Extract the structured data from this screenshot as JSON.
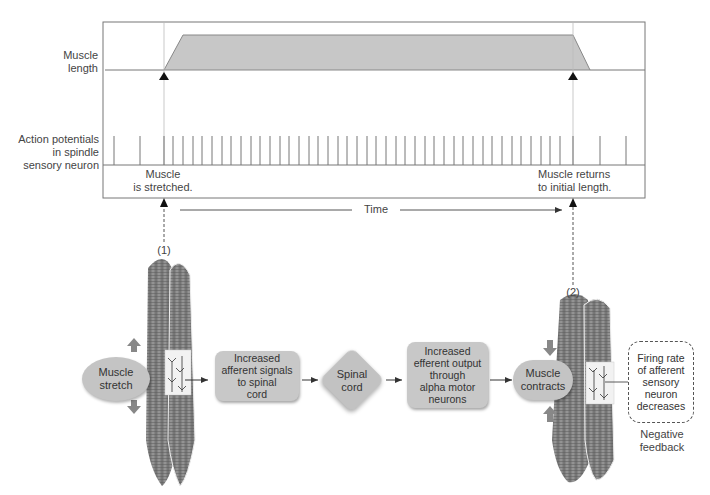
{
  "chart": {
    "muscle_length_label_1": "Muscle",
    "muscle_length_label_2": "length",
    "ap_label_1": "Action potentials",
    "ap_label_2": "in spindle",
    "ap_label_3": "sensory neuron",
    "event1_line1": "Muscle",
    "event1_line2": "is stretched.",
    "event2_line1": "Muscle returns",
    "event2_line2": "to initial length.",
    "time_label": "Time"
  },
  "chart_data": {
    "type": "line",
    "title": "",
    "series": [
      {
        "name": "Muscle length",
        "description": "baseline, rises after stretch, plateau, returns to initial length",
        "x": [
          0,
          0.11,
          0.15,
          0.87,
          0.9,
          1.0
        ],
        "values": [
          0,
          0,
          1,
          1,
          0,
          0
        ]
      },
      {
        "name": "Action potentials in spindle sensory neuron",
        "description": "spike train: low rate before stretch, high rate during stretch, low rate after return",
        "spike_x": [
          114,
          140,
          164,
          173,
          183,
          193,
          202,
          212,
          222,
          231,
          241,
          251,
          260,
          270,
          280,
          289,
          299,
          309,
          318,
          328,
          338,
          347,
          357,
          367,
          376,
          386,
          396,
          405,
          415,
          425,
          434,
          444,
          454,
          463,
          473,
          483,
          492,
          502,
          512,
          521,
          531,
          541,
          550,
          560,
          573,
          600,
          626
        ]
      }
    ],
    "xlabel": "Time",
    "annotations": [
      "Muscle is stretched.",
      "Muscle returns to initial length."
    ]
  },
  "markers": {
    "step1": "(1)",
    "step2": "(2)"
  },
  "flow": {
    "muscle_stretch_1": "Muscle",
    "muscle_stretch_2": "stretch",
    "afferent_1": "Increased",
    "afferent_2": "afferent signals",
    "afferent_3": "to spinal",
    "afferent_4": "cord",
    "spinal_1": "Spinal",
    "spinal_2": "cord",
    "efferent_1": "Increased",
    "efferent_2": "efferent output",
    "efferent_3": "through",
    "efferent_4": "alpha motor",
    "efferent_5": "neurons",
    "contracts_1": "Muscle",
    "contracts_2": "contracts",
    "firing_1": "Firing rate",
    "firing_2": "of afferent",
    "firing_3": "sensory",
    "firing_4": "neuron",
    "firing_5": "decreases",
    "neg_1": "Negative",
    "neg_2": "feedback"
  }
}
